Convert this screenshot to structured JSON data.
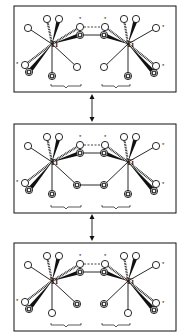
{
  "diagram": {
    "metal_label": "Ti",
    "star_label": "*",
    "panels": [
      {
        "id": "top",
        "y": 6,
        "h": 86,
        "bottom_left": "dot",
        "bottom_right": "open",
        "bottom_left2": "open",
        "bottom_right2": "dot",
        "bridge": "none"
      },
      {
        "id": "middle",
        "y": 124,
        "h": 89,
        "bottom_left": "dot",
        "bottom_right": "dot",
        "bottom_left2": "dot",
        "bottom_right2": "dot",
        "bridge": "ring"
      },
      {
        "id": "bottom",
        "y": 243,
        "h": 88,
        "bottom_left": "open",
        "bottom_right": "dot",
        "bottom_left2": "dot",
        "bottom_right2": "open",
        "bridge": "none"
      }
    ],
    "arrows": [
      {
        "from_y": 94,
        "to_y": 122
      },
      {
        "from_y": 214,
        "to_y": 241
      }
    ]
  }
}
